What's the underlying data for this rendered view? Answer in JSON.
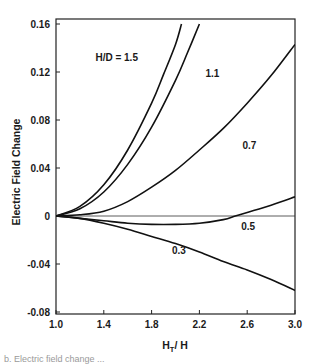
{
  "chart_data": {
    "type": "line",
    "title": "",
    "xlabel": "H_T / H",
    "xlabel_main": "H",
    "xlabel_sub": "T",
    "xlabel_rest": "/ H",
    "ylabel": "Electric Field Change",
    "xlim": [
      1.0,
      3.0
    ],
    "ylim": [
      -0.08,
      0.16
    ],
    "grid": false,
    "legend_position": "inline annotations",
    "x_ticks": [
      "1.0",
      "1.4",
      "1.8",
      "2.2",
      "2.6",
      "3.0"
    ],
    "y_ticks": [
      "0.16",
      "0.12",
      "0.08",
      "0.04",
      "0",
      "-0.04",
      "-0.08"
    ],
    "reference_line": {
      "y": 0
    },
    "series": [
      {
        "name": "H/D = 1.5",
        "label": "H/D = 1.5",
        "x": [
          1.0,
          1.2,
          1.4,
          1.6,
          1.8,
          1.9,
          2.0,
          2.05
        ],
        "y": [
          0.0,
          0.008,
          0.026,
          0.055,
          0.094,
          0.118,
          0.143,
          0.16
        ]
      },
      {
        "name": "H/D = 1.1",
        "label": "1.1",
        "x": [
          1.0,
          1.2,
          1.4,
          1.6,
          1.8,
          2.0,
          2.1,
          2.2
        ],
        "y": [
          0.0,
          0.006,
          0.02,
          0.043,
          0.074,
          0.113,
          0.136,
          0.16
        ]
      },
      {
        "name": "H/D = 0.7",
        "label": "0.7",
        "x": [
          1.0,
          1.2,
          1.4,
          1.6,
          1.8,
          2.0,
          2.2,
          2.4,
          2.6,
          2.8,
          3.0
        ],
        "y": [
          0.0,
          0.001,
          0.004,
          0.012,
          0.024,
          0.038,
          0.055,
          0.073,
          0.094,
          0.117,
          0.143
        ]
      },
      {
        "name": "H/D = 0.5",
        "label": "0.5",
        "x": [
          1.0,
          1.2,
          1.4,
          1.6,
          1.8,
          2.0,
          2.2,
          2.4,
          2.5,
          2.6,
          2.8,
          3.0
        ],
        "y": [
          0.0,
          -0.002,
          -0.004,
          -0.006,
          -0.007,
          -0.007,
          -0.006,
          -0.003,
          0.0,
          0.003,
          0.009,
          0.016
        ]
      },
      {
        "name": "H/D = 0.3",
        "label": "0.3",
        "x": [
          1.0,
          1.2,
          1.4,
          1.6,
          1.8,
          2.0,
          2.2,
          2.4,
          2.6,
          2.8,
          3.0
        ],
        "y": [
          0.0,
          -0.002,
          -0.006,
          -0.011,
          -0.017,
          -0.023,
          -0.03,
          -0.038,
          -0.045,
          -0.053,
          -0.062
        ]
      }
    ],
    "annotations": [
      {
        "text": "H/D = 1.5",
        "x": 1.33,
        "y": 0.129
      },
      {
        "text": "1.1",
        "x": 2.25,
        "y": 0.116
      },
      {
        "text": "0.7",
        "x": 2.56,
        "y": 0.056
      },
      {
        "text": "0.5",
        "x": 2.55,
        "y": -0.012
      },
      {
        "text": "0.3",
        "x": 1.97,
        "y": -0.032
      }
    ]
  },
  "caption_fragment": "b.  Electric field change ..."
}
